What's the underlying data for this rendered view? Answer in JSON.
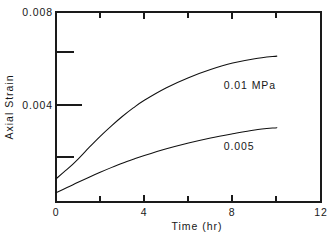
{
  "chart_data": {
    "type": "line",
    "title": "",
    "xlabel": "Time (hr)",
    "ylabel": "Axial Strain",
    "xlim": [
      0,
      12
    ],
    "ylim": [
      0,
      0.00818
    ],
    "grid": false,
    "legend_position": "inline-annotation",
    "x_ticks_major": [
      0,
      4,
      8,
      12
    ],
    "x_tick_labels": [
      "0",
      "4",
      "8",
      "12"
    ],
    "x_ticks_minor": [
      2,
      6,
      10
    ],
    "y_ticks_major": [
      0.004,
      0.008
    ],
    "y_tick_labels": [
      "0.004",
      "0.008"
    ],
    "y_ticks_minor": [
      0.002,
      0.006
    ],
    "series": [
      {
        "name": "0.01 MPa",
        "label": "0.01 MPa",
        "x": [
          0.0,
          0.5,
          1.0,
          1.5,
          2.0,
          2.5,
          3.0,
          3.5,
          4.0,
          5.0,
          6.0,
          7.0,
          8.0,
          9.0,
          10.0
        ],
        "values": [
          0.001,
          0.0014,
          0.00185,
          0.00235,
          0.00283,
          0.00327,
          0.00368,
          0.00405,
          0.00438,
          0.00492,
          0.00535,
          0.0057,
          0.00598,
          0.00617,
          0.00628
        ],
        "annotation_at": {
          "x": 7.6,
          "y": 0.00485
        }
      },
      {
        "name": "0.005",
        "label": "0.005",
        "x": [
          0.0,
          0.5,
          1.0,
          1.5,
          2.0,
          2.5,
          3.0,
          3.5,
          4.0,
          5.0,
          6.0,
          7.0,
          8.0,
          9.0,
          10.0
        ],
        "values": [
          0.0004,
          0.00062,
          0.00085,
          0.00107,
          0.00128,
          0.00148,
          0.00167,
          0.00184,
          0.002,
          0.00229,
          0.00254,
          0.00276,
          0.00294,
          0.0031,
          0.0032
        ],
        "annotation_at": {
          "x": 7.6,
          "y": 0.00225
        }
      }
    ]
  },
  "axes": {
    "x_axis_title": "Time (hr)",
    "y_axis_title": "Axial Strain"
  },
  "labels": {
    "y_top": "0.008",
    "y_mid": "0.004",
    "x0": "0",
    "x4": "4",
    "x8": "8",
    "x12": "12",
    "series_upper": "0.01 MPa",
    "series_lower": "0.005"
  },
  "colors": {
    "background": "#ffffff",
    "ink": "#181818",
    "curve": "#101010"
  }
}
